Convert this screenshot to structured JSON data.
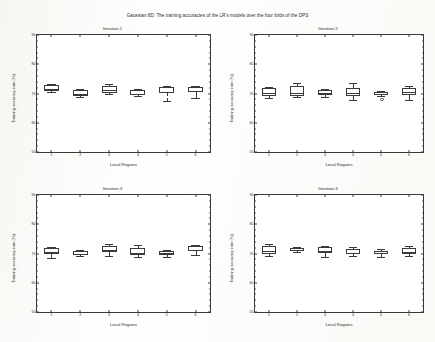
{
  "figure": {
    "title": "Gaussian 8D: The training accuracies of the LR's models over the four folds of the DPS"
  },
  "axis": {
    "xlabel": "Local Regions",
    "ylabel": "Training accuracy rate (%)",
    "yticks": [
      "90",
      "80",
      "70",
      "60",
      "50"
    ],
    "xticks": [
      "1",
      "2",
      "3",
      "4",
      "5",
      "6"
    ]
  },
  "chart_data": {
    "type": "box",
    "title": "Gaussian 8D: The training accuracies of the LR's models over the four folds of the DPS",
    "xlabel": "Local Regions",
    "ylabel": "Training accuracy rate (%)",
    "ylim": [
      50,
      90
    ],
    "ytick_values": [
      50,
      60,
      70,
      80,
      90
    ],
    "categories": [
      "1",
      "2",
      "3",
      "4",
      "5",
      "6"
    ],
    "grid": false,
    "legend": "none",
    "panels": [
      {
        "title": "Iteration 1",
        "boxes": [
          {
            "region": "1",
            "whisker_low": 70.6,
            "q1": 71.0,
            "median": 71.4,
            "q3": 73.0,
            "whisker_high": 73.4,
            "outliers": []
          },
          {
            "region": "2",
            "whisker_low": 68.9,
            "q1": 69.2,
            "median": 70.0,
            "q3": 71.3,
            "whisker_high": 71.5,
            "outliers": []
          },
          {
            "region": "3",
            "whisker_low": 69.9,
            "q1": 70.3,
            "median": 71.1,
            "q3": 72.6,
            "whisker_high": 73.1,
            "outliers": []
          },
          {
            "region": "4",
            "whisker_low": 69.0,
            "q1": 69.4,
            "median": 70.0,
            "q3": 71.2,
            "whisker_high": 71.5,
            "outliers": []
          },
          {
            "region": "5",
            "whisker_low": 67.3,
            "q1": 70.3,
            "median": 70.6,
            "q3": 72.3,
            "whisker_high": 72.5,
            "outliers": []
          },
          {
            "region": "6",
            "whisker_low": 68.6,
            "q1": 70.5,
            "median": 71.0,
            "q3": 72.2,
            "whisker_high": 72.6,
            "outliers": []
          }
        ]
      },
      {
        "title": "Iteration 2",
        "boxes": [
          {
            "region": "1",
            "whisker_low": 68.5,
            "q1": 69.2,
            "median": 70.2,
            "q3": 71.8,
            "whisker_high": 72.3,
            "outliers": []
          },
          {
            "region": "2",
            "whisker_low": 68.7,
            "q1": 69.3,
            "median": 70.1,
            "q3": 72.6,
            "whisker_high": 73.6,
            "outliers": []
          },
          {
            "region": "3",
            "whisker_low": 68.8,
            "q1": 69.6,
            "median": 70.2,
            "q3": 71.2,
            "whisker_high": 71.7,
            "outliers": []
          },
          {
            "region": "4",
            "whisker_low": 67.8,
            "q1": 69.3,
            "median": 70.1,
            "q3": 72.0,
            "whisker_high": 73.7,
            "outliers": []
          },
          {
            "region": "5",
            "whisker_low": 69.2,
            "q1": 69.6,
            "median": 69.9,
            "q3": 70.5,
            "whisker_high": 70.9,
            "outliers": [
              68.3
            ]
          },
          {
            "region": "6",
            "whisker_low": 67.9,
            "q1": 69.5,
            "median": 70.4,
            "q3": 72.0,
            "whisker_high": 72.4,
            "outliers": []
          }
        ]
      },
      {
        "title": "Iteration 3",
        "boxes": [
          {
            "region": "1",
            "whisker_low": 68.4,
            "q1": 69.8,
            "median": 70.4,
            "q3": 71.8,
            "whisker_high": 72.3,
            "outliers": []
          },
          {
            "region": "2",
            "whisker_low": 69.0,
            "q1": 69.4,
            "median": 70.0,
            "q3": 70.8,
            "whisker_high": 71.1,
            "outliers": []
          },
          {
            "region": "3",
            "whisker_low": 69.3,
            "q1": 70.6,
            "median": 71.2,
            "q3": 72.5,
            "whisker_high": 73.4,
            "outliers": []
          },
          {
            "region": "4",
            "whisker_low": 68.8,
            "q1": 69.6,
            "median": 70.3,
            "q3": 71.8,
            "whisker_high": 73.0,
            "outliers": []
          },
          {
            "region": "5",
            "whisker_low": 68.9,
            "q1": 69.6,
            "median": 70.1,
            "q3": 70.9,
            "whisker_high": 71.2,
            "outliers": []
          },
          {
            "region": "6",
            "whisker_low": 69.6,
            "q1": 70.8,
            "median": 71.3,
            "q3": 72.6,
            "whisker_high": 72.9,
            "outliers": []
          }
        ]
      },
      {
        "title": "Iteration 4",
        "boxes": [
          {
            "region": "1",
            "whisker_low": 69.3,
            "q1": 69.9,
            "median": 70.8,
            "q3": 72.4,
            "whisker_high": 73.2,
            "outliers": []
          },
          {
            "region": "2",
            "whisker_low": 70.4,
            "q1": 70.8,
            "median": 71.2,
            "q3": 71.9,
            "whisker_high": 72.3,
            "outliers": []
          },
          {
            "region": "3",
            "whisker_low": 68.8,
            "q1": 70.1,
            "median": 70.9,
            "q3": 72.2,
            "whisker_high": 72.6,
            "outliers": []
          },
          {
            "region": "4",
            "whisker_low": 69.0,
            "q1": 69.7,
            "median": 70.2,
            "q3": 71.4,
            "whisker_high": 72.1,
            "outliers": []
          },
          {
            "region": "5",
            "whisker_low": 68.7,
            "q1": 69.8,
            "median": 70.2,
            "q3": 71.0,
            "whisker_high": 71.6,
            "outliers": []
          },
          {
            "region": "6",
            "whisker_low": 69.0,
            "q1": 69.9,
            "median": 70.5,
            "q3": 71.9,
            "whisker_high": 72.5,
            "outliers": []
          }
        ]
      }
    ]
  }
}
